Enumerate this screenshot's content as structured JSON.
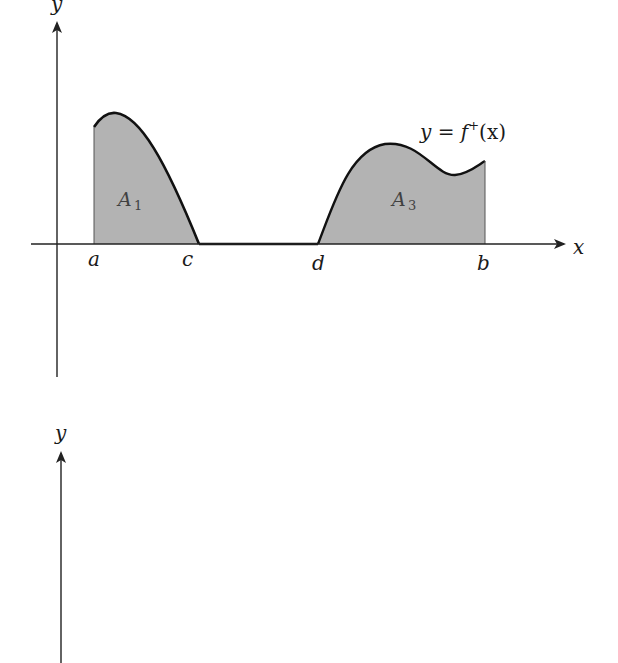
{
  "figure": {
    "top_plot": {
      "y_axis_label": "y",
      "x_axis_label": "x",
      "curve_label": {
        "prefix": "y = f",
        "superscript": "+",
        "suffix": "(x)"
      },
      "ticks": {
        "a": "a",
        "c": "c",
        "d": "d",
        "b": "b"
      },
      "regions": [
        {
          "name": "A",
          "subscript": "1",
          "between": [
            "a",
            "c"
          ]
        },
        {
          "name": "A",
          "subscript": "3",
          "between": [
            "d",
            "b"
          ]
        }
      ]
    },
    "bottom_plot": {
      "y_axis_label": "y"
    },
    "colors": {
      "axis": "#222222",
      "curve": "#111111",
      "fill": "#b3b3b3",
      "background": "#ffffff"
    }
  }
}
